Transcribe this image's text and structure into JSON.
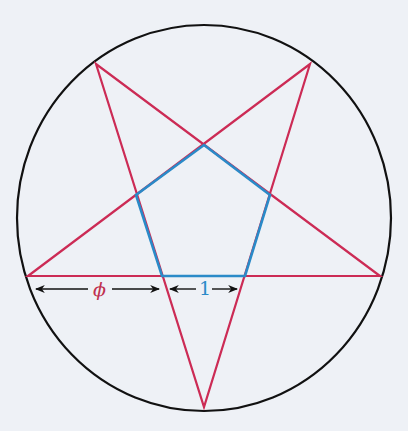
{
  "diagram": {
    "colors": {
      "background": "#eef1f6",
      "circle": "#111111",
      "star": "#cc2b55",
      "pentagon": "#2a8ac8",
      "arrow": "#111111",
      "phi_label": "#c0304f",
      "one_label": "#2a8ac8"
    },
    "circle": {
      "cx": 204,
      "cy": 218,
      "rx": 187,
      "ry": 193
    },
    "star_points": [
      {
        "name": "top-left",
        "x": 96,
        "y": 64
      },
      {
        "name": "top-right",
        "x": 310,
        "y": 64
      },
      {
        "name": "left",
        "x": 28,
        "y": 276
      },
      {
        "name": "right",
        "x": 380,
        "y": 276
      },
      {
        "name": "bottom",
        "x": 204,
        "y": 407
      }
    ],
    "pentagon_points": [
      {
        "name": "top",
        "x": 204,
        "y": 145
      },
      {
        "name": "right",
        "x": 270,
        "y": 195
      },
      {
        "name": "bottom-right",
        "x": 245,
        "y": 276
      },
      {
        "name": "bottom-left",
        "x": 162,
        "y": 276
      },
      {
        "name": "left",
        "x": 136,
        "y": 195
      }
    ],
    "labels": {
      "phi": "ϕ",
      "one": "1"
    },
    "measurements": [
      {
        "label": "ϕ",
        "from_x": 35,
        "to_x": 160,
        "y": 289
      },
      {
        "label": "1",
        "from_x": 170,
        "to_x": 238,
        "y": 289
      }
    ]
  }
}
